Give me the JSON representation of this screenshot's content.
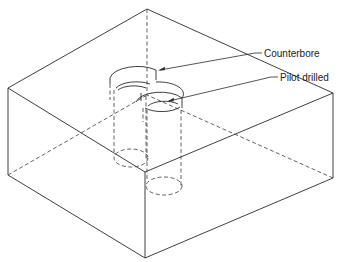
{
  "diagram": {
    "labels": {
      "counterbore": "Counterbore",
      "pilot_drilled": "Pilot drilled"
    },
    "colors": {
      "line": "#2a2a2a",
      "background": "#ffffff"
    }
  }
}
